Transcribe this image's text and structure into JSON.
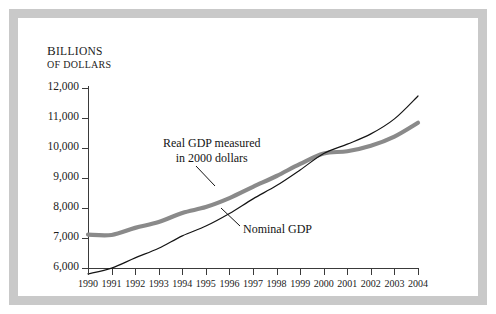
{
  "figure": {
    "background": "#ffffff",
    "frame_color": "#c9c9c9"
  },
  "axis": {
    "y_label_line1": "Billions",
    "y_label_line2": "of dollars",
    "y_ticks": [
      "12,000",
      "11,000",
      "10,000",
      "9,000",
      "8,000",
      "7,000",
      "6,000"
    ],
    "x_ticks": [
      "1990",
      "1991",
      "1992",
      "1993",
      "1994",
      "1995",
      "1996",
      "1997",
      "1998",
      "1999",
      "2000",
      "2001",
      "2002",
      "2003",
      "2004"
    ]
  },
  "annotations": {
    "real_gdp_line1": "Real GDP measured",
    "real_gdp_line2": "in 2000 dollars",
    "nominal_gdp": "Nominal GDP"
  },
  "chart_data": {
    "type": "line",
    "title": "",
    "xlabel": "",
    "ylabel": "Billions of dollars",
    "ylim": [
      5500,
      12000
    ],
    "xlim": [
      1990,
      2004
    ],
    "grid": false,
    "legend": "inline-annotations",
    "x": [
      1990,
      1991,
      1992,
      1993,
      1994,
      1995,
      1996,
      1997,
      1998,
      1999,
      2000,
      2001,
      2002,
      2003,
      2004
    ],
    "series": [
      {
        "name": "Real GDP measured in 2000 dollars",
        "color": "#8a8a8a",
        "width": 4.2,
        "values": [
          7113,
          7101,
          7337,
          7533,
          7836,
          8032,
          8329,
          8704,
          9067,
          9470,
          9817,
          9891,
          10075,
          10381,
          10842
        ]
      },
      {
        "name": "Nominal GDP",
        "color": "#141414",
        "width": 1.2,
        "values": [
          5803,
          5996,
          6338,
          6657,
          7072,
          7398,
          7817,
          8304,
          8747,
          9268,
          9817,
          10128,
          10470,
          10971,
          11734
        ]
      }
    ]
  }
}
